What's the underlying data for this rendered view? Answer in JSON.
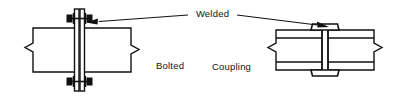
{
  "figure": {
    "title_present": false,
    "background_color": "#ffffff",
    "line_color": "#111111",
    "fill_color": "#ffffff",
    "bolt_color": "#111111",
    "width": 399,
    "height": 99
  },
  "labels": {
    "welded": "Welded",
    "bolted": "Bolted",
    "coupling": "Coupling"
  },
  "details": [
    {
      "id": "bolted-splice",
      "name": "Bolted",
      "description": "Beam splice joined with vertical splice plates and bolts"
    },
    {
      "id": "welded-coupling",
      "name": "Coupling",
      "description": "Beam splice joined with welded coupling plates top and bottom"
    }
  ],
  "annotations": [
    {
      "id": "welded-left",
      "text": "Welded",
      "points_to": "bolted-splice-plate"
    },
    {
      "id": "welded-right",
      "text": "Welded",
      "points_to": "coupling-top-plate"
    }
  ]
}
